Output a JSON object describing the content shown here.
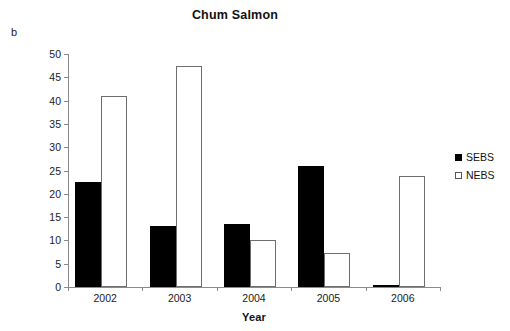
{
  "panel_letter": "b",
  "chart_data": {
    "type": "bar",
    "title": "Chum Salmon",
    "xlabel": "Year",
    "ylabel": "Average CPUE",
    "categories": [
      "2002",
      "2003",
      "2004",
      "2005",
      "2006"
    ],
    "series": [
      {
        "name": "SEBS",
        "color": "#000000",
        "fill": "solid",
        "values": [
          22.5,
          13.0,
          13.6,
          26.0,
          0.1
        ]
      },
      {
        "name": "NEBS",
        "color": "#ffffff",
        "fill": "open",
        "values": [
          41.0,
          47.5,
          10.0,
          7.2,
          23.8
        ]
      }
    ],
    "ylim": [
      0,
      50
    ],
    "yticks": [
      0,
      5,
      10,
      15,
      20,
      25,
      30,
      35,
      40,
      45,
      50
    ],
    "ytick_labels": [
      "0",
      "5",
      "10",
      "15",
      "20",
      "25",
      "30",
      "35",
      "40",
      "45",
      "50"
    ],
    "grid": false,
    "legend_position": "right",
    "legend_entries": [
      "SEBS",
      "NEBS"
    ]
  }
}
